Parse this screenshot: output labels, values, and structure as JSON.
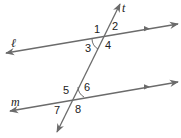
{
  "diagram": {
    "colors": {
      "line": "#6b6b6b",
      "text": "#222222",
      "background": "#ffffff"
    },
    "lines": [
      {
        "name": "t",
        "label": "t",
        "role": "transversal"
      },
      {
        "name": "l",
        "label": "ℓ",
        "role": "parallel line"
      },
      {
        "name": "m",
        "label": "m",
        "role": "parallel line"
      }
    ],
    "angles": [
      {
        "label": "1",
        "at": "t∩ℓ",
        "position": "top-left"
      },
      {
        "label": "2",
        "at": "t∩ℓ",
        "position": "top-right"
      },
      {
        "label": "3",
        "at": "t∩ℓ",
        "position": "bottom-left",
        "marked": true
      },
      {
        "label": "4",
        "at": "t∩ℓ",
        "position": "bottom-right"
      },
      {
        "label": "5",
        "at": "t∩m",
        "position": "top-left"
      },
      {
        "label": "6",
        "at": "t∩m",
        "position": "top-right",
        "marked": true
      },
      {
        "label": "7",
        "at": "t∩m",
        "position": "bottom-left"
      },
      {
        "label": "8",
        "at": "t∩m",
        "position": "bottom-right"
      }
    ]
  }
}
